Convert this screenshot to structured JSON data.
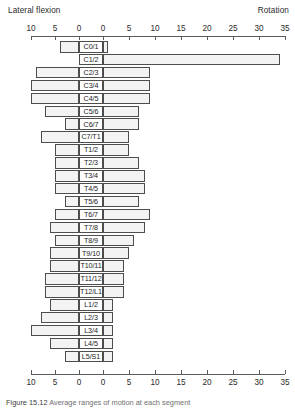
{
  "header": {
    "left_axis_title": "Lateral flexion",
    "right_axis_title": "Rotation"
  },
  "caption": {
    "figure_number": "Figure 15.12",
    "text": "Average ranges of motion at each segment"
  },
  "axis": {
    "tick_labels": [
      "10",
      "5",
      "0",
      "0",
      "5",
      "10",
      "15",
      "20",
      "25",
      "30",
      "35"
    ],
    "left_scale_max": 12,
    "right_scale_max": 35,
    "left_unit": "degrees",
    "right_unit": "degrees"
  },
  "chart_data": {
    "type": "bar",
    "orientation": "horizontal-bidirectional",
    "title": "",
    "subtitle": "",
    "xlabel": "",
    "ylabel": "",
    "xlim_left": [
      12,
      0
    ],
    "xlim_right": [
      0,
      35
    ],
    "grid": false,
    "legend_position": "top",
    "axis_titles": {
      "left": "Lateral flexion",
      "right": "Rotation"
    },
    "tick_values_left": [
      10,
      5,
      0
    ],
    "tick_values_right": [
      0,
      5,
      10,
      15,
      20,
      25,
      30,
      35
    ],
    "categories": [
      "C0/1",
      "C1/2",
      "C2/3",
      "C3/4",
      "C4/5",
      "C5/6",
      "C6/7",
      "C7/T1",
      "T1/2",
      "T2/3",
      "T3/4",
      "T4/5",
      "T5/6",
      "T6/7",
      "T7/8",
      "T8/9",
      "T9/10",
      "T10/11",
      "T11/12",
      "T12/L1",
      "L1/2",
      "L2/3",
      "L3/4",
      "L4/5",
      "L5/S1"
    ],
    "series": [
      {
        "name": "Lateral flexion",
        "direction": "left",
        "values": [
          4,
          0,
          9,
          10,
          10,
          7,
          3,
          8,
          5,
          5,
          5,
          5,
          3,
          5,
          6,
          5,
          6,
          6,
          7,
          7,
          6,
          8,
          10,
          6,
          3
        ]
      },
      {
        "name": "Rotation",
        "direction": "right",
        "values": [
          1,
          34,
          9,
          9,
          9,
          7,
          7,
          5,
          5,
          7,
          8,
          8,
          7,
          9,
          8,
          6,
          5,
          4,
          4,
          4,
          2,
          2,
          2,
          2,
          2
        ]
      }
    ]
  },
  "rows": [
    {
      "label": "C0/1",
      "left": 4,
      "right": 1
    },
    {
      "label": "C1/2",
      "left": 0,
      "right": 34
    },
    {
      "label": "C2/3",
      "left": 9,
      "right": 9
    },
    {
      "label": "C3/4",
      "left": 10,
      "right": 9
    },
    {
      "label": "C4/5",
      "left": 10,
      "right": 9
    },
    {
      "label": "C5/6",
      "left": 7,
      "right": 7
    },
    {
      "label": "C6/7",
      "left": 3,
      "right": 7
    },
    {
      "label": "C7/T1",
      "left": 8,
      "right": 5
    },
    {
      "label": "T1/2",
      "left": 5,
      "right": 5
    },
    {
      "label": "T2/3",
      "left": 5,
      "right": 7
    },
    {
      "label": "T3/4",
      "left": 5,
      "right": 8
    },
    {
      "label": "T4/5",
      "left": 5,
      "right": 8
    },
    {
      "label": "T5/6",
      "left": 3,
      "right": 7
    },
    {
      "label": "T6/7",
      "left": 5,
      "right": 9
    },
    {
      "label": "T7/8",
      "left": 6,
      "right": 8
    },
    {
      "label": "T8/9",
      "left": 5,
      "right": 6
    },
    {
      "label": "T9/10",
      "left": 6,
      "right": 5
    },
    {
      "label": "T10/11",
      "left": 6,
      "right": 4
    },
    {
      "label": "T11/12",
      "left": 7,
      "right": 4
    },
    {
      "label": "T12/L1",
      "left": 7,
      "right": 4
    },
    {
      "label": "L1/2",
      "left": 6,
      "right": 2
    },
    {
      "label": "L2/3",
      "left": 8,
      "right": 2
    },
    {
      "label": "L3/4",
      "left": 10,
      "right": 2
    },
    {
      "label": "L4/5",
      "left": 6,
      "right": 2
    },
    {
      "label": "L5/S1",
      "left": 3,
      "right": 2
    }
  ]
}
